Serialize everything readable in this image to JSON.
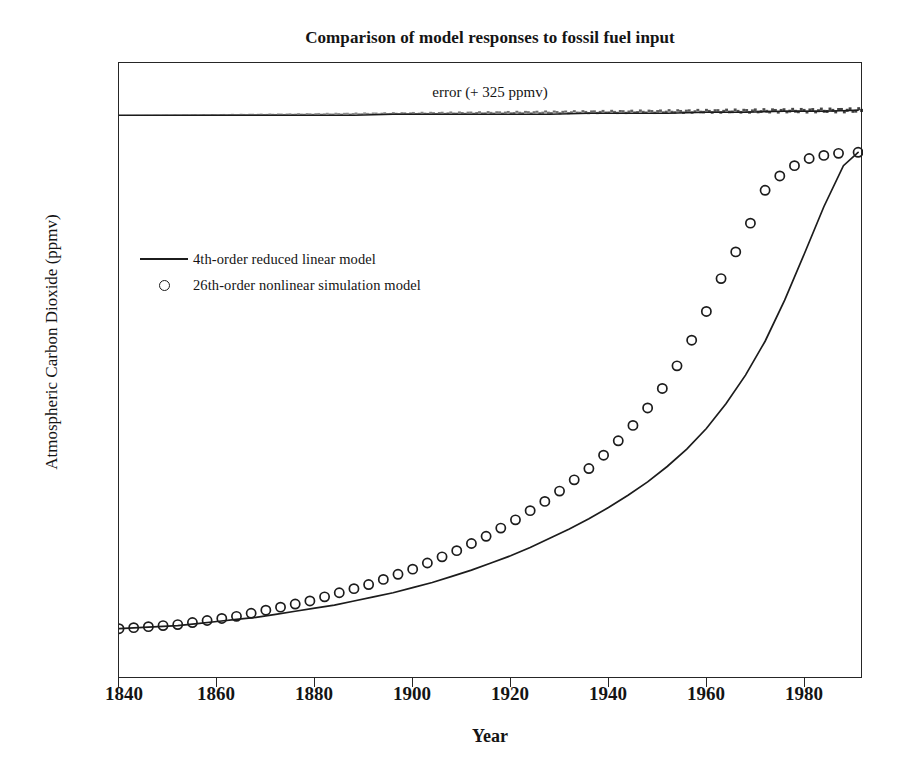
{
  "chart_data": {
    "type": "line",
    "title": "Comparison of model responses to fossil fuel input",
    "xlabel": "Year",
    "ylabel": "Atmospheric Carbon Dioxide (ppmv)",
    "xlim": [
      1840,
      1992
    ],
    "ylim": [
      270,
      330
    ],
    "xticks": [
      1840,
      1860,
      1880,
      1900,
      1920,
      1940,
      1960,
      1980
    ],
    "yticks": [
      270,
      280,
      290,
      300,
      310,
      320,
      330
    ],
    "grid": false,
    "legend_position": "upper left inside",
    "annotations": [
      {
        "text": "error (+ 325 ppmv)",
        "x": 1916,
        "y": 327.8,
        "describes_series": "error (offset +325 ppmv)"
      }
    ],
    "series": [
      {
        "name": "4th-order reduced linear model",
        "style": "solid line",
        "color": "#1c1c1c",
        "x": [
          1840,
          1844,
          1848,
          1852,
          1856,
          1860,
          1864,
          1868,
          1872,
          1876,
          1880,
          1884,
          1888,
          1892,
          1896,
          1900,
          1904,
          1908,
          1912,
          1916,
          1920,
          1924,
          1928,
          1932,
          1936,
          1940,
          1944,
          1948,
          1952,
          1956,
          1960,
          1964,
          1968,
          1972,
          1976,
          1980,
          1984,
          1988,
          1991
        ],
        "y": [
          274.9,
          275.0,
          275.1,
          275.2,
          275.4,
          275.6,
          275.8,
          276.0,
          276.3,
          276.6,
          276.9,
          277.2,
          277.6,
          278.0,
          278.4,
          278.9,
          279.4,
          280.0,
          280.6,
          281.3,
          282.0,
          282.8,
          283.7,
          284.6,
          285.6,
          286.7,
          287.9,
          289.2,
          290.7,
          292.4,
          294.4,
          296.8,
          299.6,
          302.9,
          306.9,
          311.4,
          316.0,
          320.0,
          321.3
        ]
      },
      {
        "name": "26th-order nonlinear simulation model",
        "style": "open circle markers",
        "color": "#1c1c1c",
        "x": [
          1840,
          1843,
          1846,
          1849,
          1852,
          1855,
          1858,
          1861,
          1864,
          1867,
          1870,
          1873,
          1876,
          1879,
          1882,
          1885,
          1888,
          1891,
          1894,
          1897,
          1900,
          1903,
          1906,
          1909,
          1912,
          1915,
          1918,
          1921,
          1924,
          1927,
          1930,
          1933,
          1936,
          1939,
          1942,
          1945,
          1948,
          1951,
          1954,
          1957,
          1960,
          1963,
          1966,
          1969,
          1972,
          1975,
          1978,
          1981,
          1984,
          1987,
          1991
        ],
        "y": [
          274.9,
          275.0,
          275.1,
          275.2,
          275.3,
          275.5,
          275.7,
          275.9,
          276.1,
          276.4,
          276.7,
          277.0,
          277.3,
          277.6,
          278.0,
          278.4,
          278.8,
          279.2,
          279.7,
          280.2,
          280.7,
          281.3,
          281.9,
          282.5,
          283.2,
          283.9,
          284.7,
          285.5,
          286.4,
          287.3,
          288.3,
          289.4,
          290.5,
          291.8,
          293.2,
          294.7,
          296.4,
          298.3,
          300.5,
          303.0,
          305.8,
          309.0,
          311.6,
          314.4,
          317.6,
          319.0,
          320.0,
          320.7,
          321.0,
          321.2,
          321.3
        ]
      },
      {
        "name": "error (offset +325 ppmv)",
        "style": "solid line, noisy",
        "color": "#1c1c1c",
        "x": [
          1840,
          1848,
          1856,
          1864,
          1872,
          1880,
          1888,
          1896,
          1904,
          1912,
          1920,
          1928,
          1936,
          1944,
          1952,
          1960,
          1968,
          1976,
          1984,
          1991
        ],
        "y": [
          324.9,
          324.9,
          324.9,
          324.9,
          324.9,
          324.9,
          324.9,
          325.0,
          325.0,
          325.0,
          325.0,
          325.0,
          325.1,
          325.1,
          325.1,
          325.2,
          325.2,
          325.3,
          325.3,
          325.4
        ]
      }
    ]
  },
  "axes": {
    "y_tick_labels": [
      "330",
      "320",
      "310",
      "300",
      "290",
      "280",
      "270"
    ],
    "x_tick_labels": [
      "1840",
      "1860",
      "1880",
      "1900",
      "1920",
      "1940",
      "1960",
      "1980"
    ],
    "x_title": "Year",
    "y_title": "Atmospheric Carbon Dioxide (ppmv)"
  },
  "title": "Comparison of model responses to fossil fuel input",
  "annotation": {
    "error_label": "error (+ 325 ppmv)"
  },
  "legend": {
    "entries": [
      {
        "label": "4th-order reduced linear model",
        "key": "line-key-icon"
      },
      {
        "label": "26th-order nonlinear simulation model",
        "key": "circle-marker-icon"
      }
    ]
  },
  "colors": {
    "ink": "#1c1c1c",
    "axis": "#262626",
    "background": "#ffffff"
  }
}
